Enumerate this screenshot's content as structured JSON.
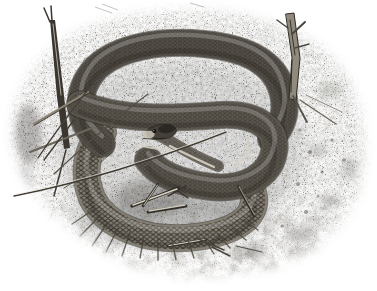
{
  "figure": {
    "alt": "Black-and-white stipple pen-and-ink illustration of a snake coiled on a patch of gravelly ground, framed as a soft-edged oval vignette on white paper",
    "medium": "stipple ink drawing, grayscale",
    "background_color": "#ffffff",
    "palette": {
      "paper": "#ffffff",
      "ink_dark": "#221f1a",
      "snake_mid": "#544f48",
      "snake_light_band": "#837d72",
      "pale_stripe": "#d6d1c4",
      "gravel_speck": "#5c584f",
      "twig_dark": "#342f28",
      "twig_light": "#cfcabd"
    },
    "elements": {
      "ground": "oval stippled gravel patch fading to white edges",
      "snake": "snake coiled in overlapping loops, head at center pointing left, pale stripe along neck, lighter latticed lower coil",
      "left_twig": "upright dry twig at upper left crossing the coils",
      "right_twig": "broken branched stick at upper right",
      "grass": "thin grass blades crossing the coils from lower left",
      "litter": "small twigs and debris inside the lower coil and on the gravel",
      "fringe": "dark grass fringe radiating below the bottom coil"
    }
  }
}
